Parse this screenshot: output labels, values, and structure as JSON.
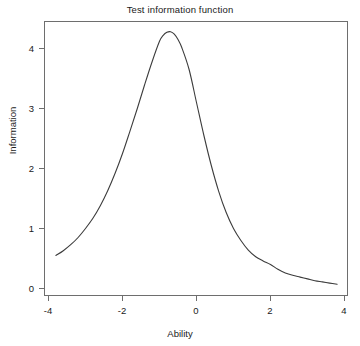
{
  "chart_data": {
    "type": "line",
    "title": "Test information function",
    "xlabel": "Ability",
    "ylabel": "Information",
    "xlim": [
      -4,
      4
    ],
    "ylim": [
      0,
      4.45
    ],
    "grid": false,
    "legend": null,
    "xticks": [
      -4,
      -2,
      0,
      2,
      4
    ],
    "xticklabels": [
      "-4",
      "-2",
      "0",
      "2",
      "4"
    ],
    "yticks": [
      0,
      1,
      2,
      3,
      4
    ],
    "yticklabels": [
      "0",
      "1",
      "2",
      "3",
      "4"
    ],
    "line_color": "#3c3c3c",
    "series": [
      {
        "name": "Test information",
        "x": [
          -3.8,
          -3.6,
          -3.4,
          -3.2,
          -3.0,
          -2.8,
          -2.6,
          -2.4,
          -2.2,
          -2.0,
          -1.8,
          -1.6,
          -1.4,
          -1.2,
          -1.0,
          -0.9,
          -0.8,
          -0.7,
          -0.6,
          -0.5,
          -0.4,
          -0.2,
          0.0,
          0.2,
          0.4,
          0.6,
          0.8,
          1.0,
          1.2,
          1.4,
          1.6,
          1.8,
          2.0,
          2.2,
          2.4,
          2.6,
          2.8,
          3.0,
          3.2,
          3.4,
          3.6,
          3.8
        ],
        "y": [
          0.55,
          0.63,
          0.73,
          0.85,
          1.0,
          1.17,
          1.38,
          1.63,
          1.92,
          2.25,
          2.62,
          3.0,
          3.4,
          3.78,
          4.12,
          4.22,
          4.27,
          4.28,
          4.24,
          4.15,
          4.02,
          3.65,
          3.1,
          2.55,
          2.05,
          1.62,
          1.27,
          1.0,
          0.8,
          0.64,
          0.53,
          0.46,
          0.4,
          0.32,
          0.26,
          0.22,
          0.19,
          0.16,
          0.13,
          0.11,
          0.09,
          0.07
        ]
      }
    ],
    "peak": {
      "x": -0.75,
      "y": 4.28
    }
  },
  "annotations": {
    "title_text": "Test information function",
    "x_axis_label": "Ability",
    "y_axis_label": "Information"
  }
}
